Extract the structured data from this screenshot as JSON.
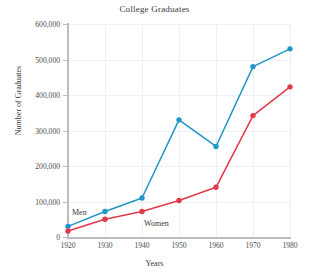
{
  "chart_data": {
    "type": "line",
    "title": "College Graduates",
    "xlabel": "Years",
    "ylabel": "Number of Graduates",
    "x": [
      1920,
      1930,
      1940,
      1950,
      1960,
      1970,
      1980
    ],
    "xtick_labels": [
      "1920",
      "1930",
      "1940",
      "1950",
      "1960",
      "1970",
      "1980"
    ],
    "ytick_labels": [
      "0",
      "100,000",
      "200,000",
      "300,000",
      "400,000",
      "500,000",
      "600,000"
    ],
    "ytick_values": [
      0,
      100000,
      200000,
      300000,
      400000,
      500000,
      600000
    ],
    "xlim": [
      1920,
      1980
    ],
    "ylim": [
      0,
      600000
    ],
    "grid": true,
    "legend_position": "inline-annotations",
    "series": [
      {
        "name": "Men",
        "color": "#2196c8",
        "marker": "circle",
        "values": [
          30000,
          72000,
          110000,
          330000,
          255000,
          480000,
          530000
        ]
      },
      {
        "name": "Women",
        "color": "#e0394c",
        "marker": "circle",
        "values": [
          17000,
          50000,
          72000,
          103000,
          140000,
          342000,
          423000
        ]
      }
    ],
    "annotations": [
      {
        "text": "Men",
        "series": "Men",
        "x_px": 72,
        "y_px": 208
      },
      {
        "text": "Women",
        "series": "Women",
        "x_px": 144,
        "y_px": 219
      }
    ]
  },
  "axis_colors": {
    "axis_line": "#b9bcc0",
    "gridline": "#eef1f4",
    "text": "#3a3a3a",
    "background": "#ffffff"
  }
}
